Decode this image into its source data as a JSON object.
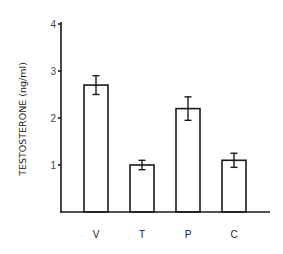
{
  "chart_data": {
    "type": "bar",
    "title": "",
    "xlabel": "",
    "ylabel": "TESTOSTERONE (ng/ml)",
    "categories": [
      "V",
      "T",
      "P",
      "C"
    ],
    "values": [
      2.7,
      1.0,
      2.2,
      1.1
    ],
    "error": [
      0.2,
      0.1,
      0.25,
      0.15
    ],
    "ylim": [
      0,
      4
    ],
    "yticks": [
      "1",
      "2",
      "3",
      "4"
    ],
    "grid": false,
    "legend": null,
    "bar_fill": "#ffffff",
    "bar_stroke": "#1a1a1a"
  }
}
